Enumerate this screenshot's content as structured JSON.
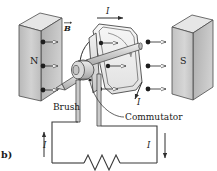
{
  "figure": {
    "panel_label": "b)",
    "title_alt": "DC motor with commutator and brushes",
    "colors": {
      "magnet_front": "#c9c9c9",
      "magnet_top": "#e3e3e3",
      "magnet_side": "#9e9e9e",
      "magnet_outline": "#4a4a4a",
      "wire": "#3a3a3a",
      "coil_fill": "#dcdcdc",
      "shaft_fill": "#cfcfcf",
      "text": "#1a1a1a"
    }
  },
  "magnets": {
    "north": {
      "label": "N"
    },
    "south": {
      "label": "S"
    }
  },
  "field": {
    "label": "B",
    "arrow_count": 3,
    "direction": "left-to-right"
  },
  "currents": {
    "top": {
      "label": "I"
    },
    "coil_right": {
      "label": "I"
    },
    "circuit_left": {
      "label": "I",
      "direction": "up"
    },
    "circuit_right": {
      "label": "I",
      "direction": "down"
    }
  },
  "parts": {
    "brush": {
      "label": "Brush"
    },
    "commutator": {
      "label": "Commutator"
    }
  },
  "circuit": {
    "resistor": {
      "name": "resistor-zigzag",
      "peaks": 3
    }
  }
}
